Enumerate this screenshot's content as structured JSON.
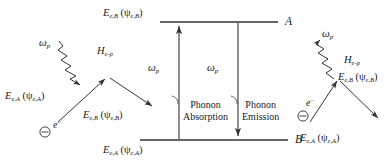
{
  "figure": {
    "type": "energy-level-and-vertex-diagram",
    "background": "#ffffff",
    "stroke_color": "#333333",
    "width": 385,
    "height": 166
  },
  "left_vertex": {
    "phonon_label": "ω",
    "phonon_sub": "p",
    "interaction_label": "H",
    "interaction_sub": "e-p",
    "incoming_electron_energy": "E",
    "incoming_electron_sub": "e,A",
    "incoming_electron_wave_open": " (ψ",
    "incoming_electron_wave_sub": "e,A",
    "incoming_electron_wave_close": ")",
    "outgoing_electron_energy": "E",
    "outgoing_electron_sub": "e,B",
    "outgoing_electron_wave_open": " (ψ",
    "outgoing_electron_wave_sub": "e,B",
    "outgoing_electron_wave_close": ")",
    "electron_symbol": "⊖",
    "electron_label": "e",
    "electron_charge": "−",
    "process": "phonon absorption vertex"
  },
  "center_diagram": {
    "upper_level_energy": "E",
    "upper_level_sub": "e,B",
    "upper_level_wave_open": " (ψ",
    "upper_level_wave_sub": "e,B",
    "upper_level_wave_close": ")",
    "upper_level_name": "A",
    "lower_level_energy": "E",
    "lower_level_sub": "e,A",
    "lower_level_wave_open": " (ψ",
    "lower_level_wave_sub": "e,A",
    "lower_level_wave_close": ")",
    "lower_level_name": "B",
    "absorption_omega": "ω",
    "absorption_omega_sub": "p",
    "absorption_line1": "Phonon",
    "absorption_line2": "Absorption",
    "emission_omega": "ω",
    "emission_omega_sub": "p",
    "emission_line1": "Phonon",
    "emission_line2": "Emission"
  },
  "right_vertex": {
    "phonon_label": "ω",
    "phonon_sub": "p",
    "interaction_label": "H",
    "interaction_sub": "e-p",
    "incoming_electron_energy": "E",
    "incoming_electron_sub": "e,A",
    "incoming_electron_wave_open": " (ψ",
    "incoming_electron_wave_sub": "e,A",
    "incoming_electron_wave_close": ")",
    "outgoing_electron_energy": "E",
    "outgoing_electron_sub": "e,B",
    "outgoing_electron_wave_open": " (ψ",
    "outgoing_electron_wave_sub": "e,B",
    "outgoing_electron_wave_close": ")",
    "electron_symbol": "⊖",
    "electron_label": "e",
    "electron_charge": "−",
    "process": "phonon emission vertex"
  }
}
